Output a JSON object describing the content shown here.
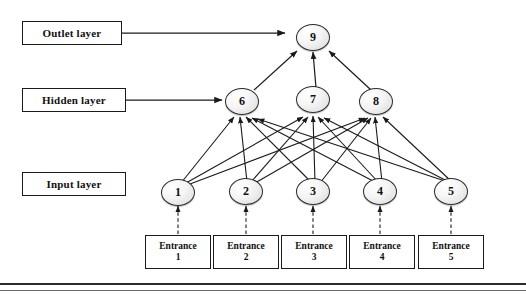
{
  "diagram": {
    "type": "neural-network",
    "title": "",
    "labels": [
      {
        "id": "outlet",
        "text": "Outlet layer"
      },
      {
        "id": "hidden",
        "text": "Hidden layer"
      },
      {
        "id": "input",
        "text": "Input layer"
      }
    ],
    "nodes": {
      "output": [
        {
          "id": 9,
          "label": "9"
        }
      ],
      "hidden": [
        {
          "id": 6,
          "label": "6"
        },
        {
          "id": 7,
          "label": "7"
        },
        {
          "id": 8,
          "label": "8"
        }
      ],
      "input": [
        {
          "id": 1,
          "label": "1"
        },
        {
          "id": 2,
          "label": "2"
        },
        {
          "id": 3,
          "label": "3"
        },
        {
          "id": 4,
          "label": "4"
        },
        {
          "id": 5,
          "label": "5"
        }
      ]
    },
    "entrances": [
      {
        "line1": "Entrance",
        "line2": "1"
      },
      {
        "line1": "Entrance",
        "line2": "2"
      },
      {
        "line1": "Entrance",
        "line2": "3"
      },
      {
        "line1": "Entrance",
        "line2": "4"
      },
      {
        "line1": "Entrance",
        "line2": "5"
      }
    ],
    "colors": {
      "stroke": "#1a1a1a",
      "node_fill": "#f0f0f0",
      "background": "#ffffff"
    }
  }
}
